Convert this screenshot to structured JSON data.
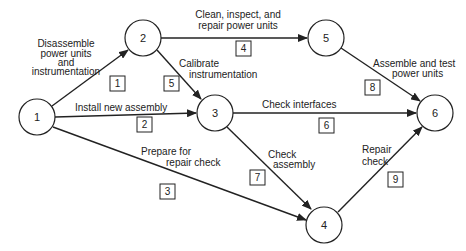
{
  "nodes": [
    {
      "id": "1",
      "label": "1"
    },
    {
      "id": "2",
      "label": "2"
    },
    {
      "id": "3",
      "label": "3"
    },
    {
      "id": "4",
      "label": "4"
    },
    {
      "id": "5",
      "label": "5"
    },
    {
      "id": "6",
      "label": "6"
    }
  ],
  "activities": [
    {
      "num": "1",
      "from": "1",
      "to": "2",
      "label_lines": [
        "Disassemble",
        "power units",
        "and",
        "instrumentation"
      ]
    },
    {
      "num": "2",
      "from": "1",
      "to": "3",
      "label_lines": [
        "Install new assembly"
      ]
    },
    {
      "num": "3",
      "from": "1",
      "to": "4",
      "label_lines": [
        "Prepare for",
        "repair check"
      ]
    },
    {
      "num": "4",
      "from": "2",
      "to": "5",
      "label_lines": [
        "Clean, inspect, and",
        "repair power units"
      ]
    },
    {
      "num": "5",
      "from": "2",
      "to": "3",
      "label_lines": [
        "Calibrate",
        "instrumentation"
      ]
    },
    {
      "num": "6",
      "from": "3",
      "to": "6",
      "label_lines": [
        "Check interfaces"
      ]
    },
    {
      "num": "7",
      "from": "3",
      "to": "4",
      "label_lines": [
        "Check",
        "assembly"
      ]
    },
    {
      "num": "8",
      "from": "5",
      "to": "6",
      "label_lines": [
        "Assemble and test",
        "power units"
      ]
    },
    {
      "num": "9",
      "from": "4",
      "to": "6",
      "label_lines": [
        "Repair",
        "check"
      ]
    }
  ]
}
